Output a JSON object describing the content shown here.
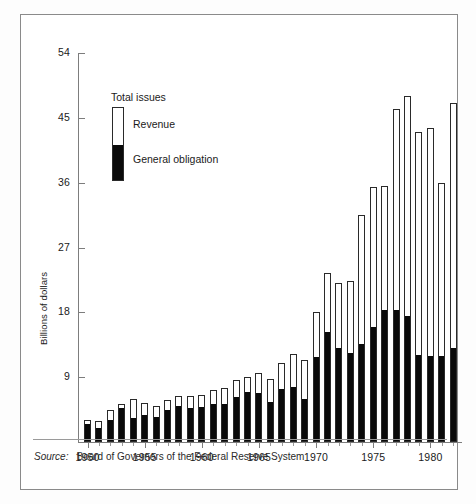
{
  "chart_data": {
    "type": "bar",
    "subtype": "stacked",
    "title": "",
    "xlabel": "",
    "ylabel": "Billions of dollars",
    "ylim": [
      0,
      54
    ],
    "yticks": [
      9,
      18,
      27,
      36,
      45,
      54
    ],
    "ytick_labels": [
      "9",
      "18",
      "27",
      "36",
      "45",
      "54"
    ],
    "xtick_labels": [
      "1950",
      "1955",
      "1960",
      "1965",
      "1970",
      "1975",
      "1980"
    ],
    "xticks": [
      1950,
      1955,
      1960,
      1965,
      1970,
      1975,
      1980
    ],
    "grid": false,
    "legend_position": "upper-left",
    "legend_title": "Total issues",
    "categories": [
      "1950",
      "1951",
      "1952",
      "1953",
      "1954",
      "1955",
      "1956",
      "1957",
      "1958",
      "1959",
      "1960",
      "1961",
      "1962",
      "1963",
      "1964",
      "1965",
      "1966",
      "1967",
      "1968",
      "1969",
      "1970",
      "1971",
      "1972",
      "1973",
      "1974",
      "1975",
      "1976",
      "1977",
      "1978",
      "1979",
      "1980",
      "1981",
      "1982"
    ],
    "series": [
      {
        "name": "General obligation",
        "color": "#0a0a0a",
        "values": [
          2.5,
          2.0,
          3.1,
          4.7,
          3.3,
          3.8,
          3.5,
          4.5,
          5.0,
          4.7,
          4.8,
          5.2,
          5.3,
          6.3,
          7.0,
          6.8,
          5.6,
          7.3,
          7.6,
          6.0,
          11.8,
          15.2,
          13.1,
          12.3,
          13.6,
          16.0,
          18.4,
          18.3,
          17.5,
          12.1,
          12.0,
          12.0,
          13.0
        ]
      },
      {
        "name": "Revenue",
        "color": "#ffffff",
        "values": [
          0.5,
          0.9,
          1.3,
          0.6,
          2.7,
          1.6,
          1.5,
          1.3,
          1.4,
          1.7,
          1.8,
          2.0,
          2.2,
          2.3,
          2.0,
          2.8,
          3.2,
          3.7,
          4.6,
          5.4,
          6.2,
          8.3,
          9.0,
          10.1,
          17.9,
          19.4,
          17.2,
          28.0,
          30.5,
          31.0,
          31.6,
          24.0,
          34.0
        ]
      }
    ],
    "totals": [
      3.0,
      2.9,
      4.4,
      5.3,
      6.0,
      5.4,
      5.0,
      5.8,
      6.4,
      6.4,
      6.6,
      7.2,
      7.5,
      8.6,
      9.0,
      9.6,
      8.8,
      11.0,
      12.2,
      11.4,
      18.0,
      23.5,
      22.1,
      22.4,
      31.5,
      35.4,
      35.6,
      46.3,
      48.0,
      43.1,
      43.6,
      36.0,
      47.0
    ]
  },
  "legend": {
    "title": "Total issues",
    "revenue_label": "Revenue",
    "general_obligation_label": "General obligation"
  },
  "axis": {
    "y_title": "Billions of dollars"
  },
  "source": {
    "label": "Source:",
    "text": "Board of Governors of the Federal Reserve System"
  }
}
